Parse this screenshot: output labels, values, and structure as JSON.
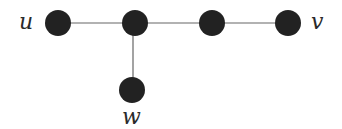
{
  "diagram": {
    "type": "graph",
    "colors": {
      "node_fill": "#222222",
      "edge_stroke": "#666666",
      "label_color": "#2a2a2a",
      "background": "#ffffff"
    },
    "nodes": [
      {
        "id": "u",
        "label": "u",
        "cx": 58,
        "cy": 23,
        "r": 13
      },
      {
        "id": "a",
        "label": "",
        "cx": 135,
        "cy": 23,
        "r": 13
      },
      {
        "id": "b",
        "label": "",
        "cx": 212,
        "cy": 23,
        "r": 13
      },
      {
        "id": "v",
        "label": "v",
        "cx": 288,
        "cy": 23,
        "r": 13
      },
      {
        "id": "w",
        "label": "w",
        "cx": 132,
        "cy": 90,
        "r": 13
      }
    ],
    "edges": [
      {
        "from": "u",
        "to": "a"
      },
      {
        "from": "a",
        "to": "b"
      },
      {
        "from": "b",
        "to": "v"
      },
      {
        "from": "a",
        "to": "w"
      }
    ],
    "labels": {
      "u": "u",
      "v": "v",
      "w": "w"
    }
  }
}
